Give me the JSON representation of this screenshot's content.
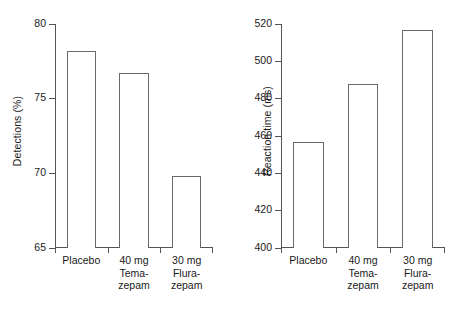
{
  "chart_data": [
    {
      "type": "bar",
      "panel": "left",
      "title": "",
      "xlabel": "",
      "ylabel": "Detections (%)",
      "categories": [
        "Placebo",
        "40 mg\nTema-\nzepam",
        "30 mg\nFlura-\nzepam"
      ],
      "values": [
        78.2,
        76.7,
        69.8
      ],
      "ylim": [
        65,
        80
      ],
      "yticks": [
        65,
        70,
        75,
        80
      ],
      "ytick_labels": [
        "65",
        "70",
        "75",
        "80"
      ],
      "grid": false,
      "legend": "none",
      "bar_fill": "#ffffff",
      "bar_edge": "#6a6a6a",
      "axis_color": "#555555"
    },
    {
      "type": "bar",
      "panel": "right",
      "title": "",
      "xlabel": "",
      "ylabel": "Reaction time (ms)",
      "categories": [
        "Placebo",
        "40 mg\nTema-\nzepam",
        "30 mg\nFlura-\nzepam"
      ],
      "values": [
        457,
        488,
        517
      ],
      "ylim": [
        400,
        520
      ],
      "yticks": [
        400,
        420,
        440,
        460,
        480,
        500,
        520
      ],
      "ytick_labels": [
        "400",
        "420",
        "440",
        "460",
        "480",
        "500",
        "520"
      ],
      "grid": false,
      "legend": "none",
      "bar_fill": "#ffffff",
      "bar_edge": "#6a6a6a",
      "axis_color": "#555555"
    }
  ],
  "left": {
    "ylabel": "Detections (%)",
    "yticks": [
      "80",
      "75",
      "70",
      "65"
    ],
    "cats": [
      "Placebo",
      "40 mg\nTema-\nzepam",
      "30 mg\nFlura-\nzepam"
    ]
  },
  "right": {
    "ylabel": "Reaction time (ms)",
    "yticks": [
      "520",
      "500",
      "480",
      "460",
      "440",
      "420",
      "400"
    ],
    "cats": [
      "Placebo",
      "40 mg\nTema-\nzepam",
      "30 mg\nFlura-\nzepam"
    ]
  }
}
